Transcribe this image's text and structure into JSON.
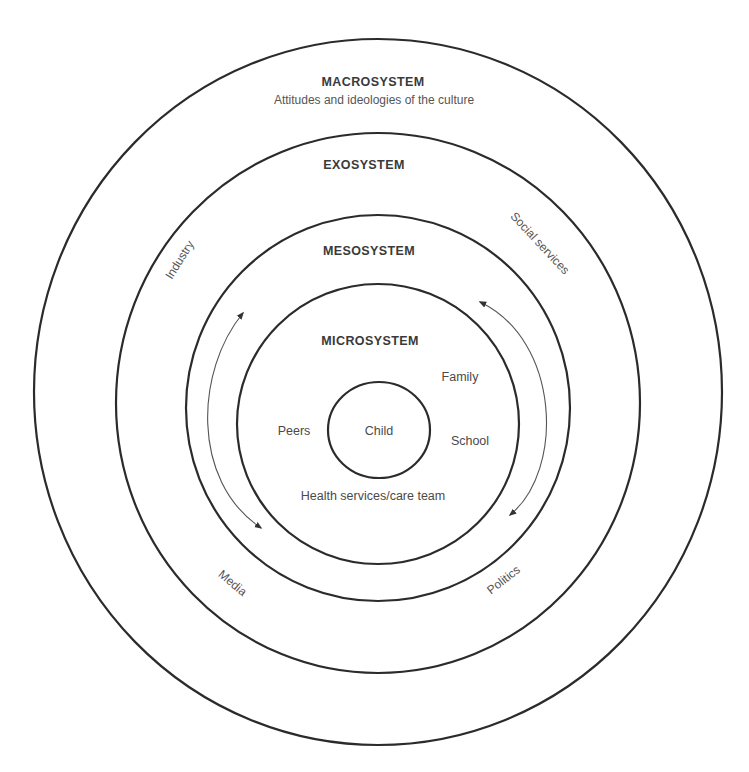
{
  "diagram": {
    "layers": {
      "macrosystem": {
        "title": "MACROSYSTEM",
        "subtitle": "Attitudes and ideologies of the culture"
      },
      "exosystem": {
        "title": "EXOSYSTEM",
        "items": [
          "Industry",
          "Social services",
          "Media",
          "Politics"
        ]
      },
      "mesosystem": {
        "title": "MESOSYSTEM"
      },
      "microsystem": {
        "title": "MICROSYSTEM",
        "items": [
          "Family",
          "Peers",
          "School",
          "Health services/care team"
        ]
      },
      "center": {
        "label": "Child"
      }
    },
    "arrows": [
      "bidirectional-left",
      "bidirectional-right"
    ],
    "colors": {
      "stroke": "#2b2b2b",
      "title_text": "#3a3a3a",
      "label_text": "#4a4a4a",
      "background": "#ffffff"
    }
  }
}
